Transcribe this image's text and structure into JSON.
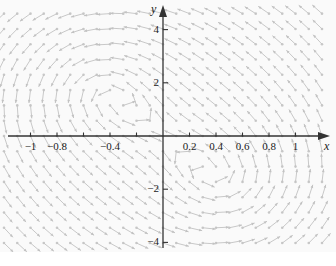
{
  "figure": {
    "kind": "direction-field",
    "background_color": "#fafafa",
    "page_background_color": "#ffffff",
    "axis_color": "#333333",
    "arrow_color": "#c2c2c2",
    "dot_color": "#c8c8c8",
    "text_color": "#1a1a1a"
  },
  "axes": {
    "x_name": "x",
    "y_name": "y",
    "x_ticks": [
      {
        "value": -1,
        "label": "−1"
      },
      {
        "value": -0.8,
        "label": "−0.8"
      },
      {
        "value": -0.6,
        "label": ""
      },
      {
        "value": -0.4,
        "label": "−0.4"
      },
      {
        "value": -0.2,
        "label": ""
      },
      {
        "value": 0.2,
        "label": "0.2"
      },
      {
        "value": 0.4,
        "label": "0.4"
      },
      {
        "value": 0.6,
        "label": "0.6"
      },
      {
        "value": 0.8,
        "label": "0.8"
      },
      {
        "value": 1,
        "label": "1"
      }
    ],
    "y_ticks": [
      {
        "value": 4,
        "label": "4"
      },
      {
        "value": 2,
        "label": "2"
      },
      {
        "value": -2,
        "label": "−2"
      },
      {
        "value": -4,
        "label": "−4"
      }
    ]
  },
  "chart_data": {
    "type": "scatter",
    "title": "",
    "xlabel": "x",
    "ylabel": "y",
    "xlim": [
      -1.23,
      1.31
    ],
    "ylim": [
      -4.85,
      4.92
    ],
    "grid": false,
    "legend": null,
    "field": {
      "x_start": -1.2,
      "x_end": 1.25,
      "x_step": 0.1,
      "y_start": -4.6,
      "y_end": 4.6,
      "y_step": 0.575,
      "centers": [
        {
          "x": -0.5,
          "y": 2.0,
          "sense": "counterclockwise"
        },
        {
          "x": 0.5,
          "y": -2.0,
          "sense": "counterclockwise"
        }
      ],
      "arrow_length_px": 13,
      "tail_dot_radius_px": 1.3
    }
  }
}
